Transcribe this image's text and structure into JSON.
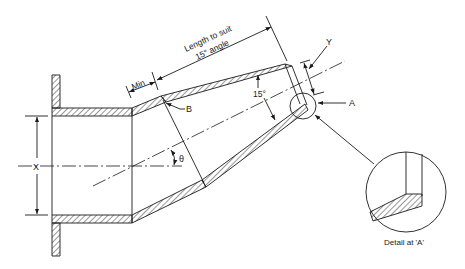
{
  "diagram": {
    "labels": {
      "length_line1": "Length to suit",
      "length_line2": "15° angle",
      "min": "Min",
      "b": "B",
      "y": "Y",
      "a": "A",
      "angle_15": "15°",
      "theta": "θ",
      "x": "X",
      "detail_caption": "Detail at 'A'"
    },
    "colors": {
      "line": "#1a1a1a",
      "background": "#ffffff"
    }
  }
}
